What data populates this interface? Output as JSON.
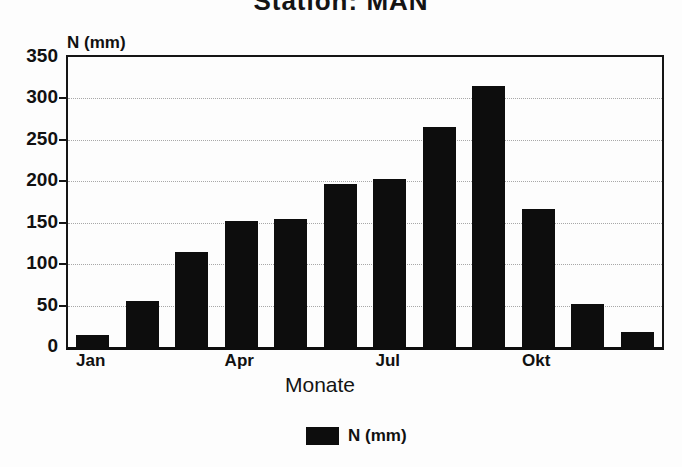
{
  "chart_data": {
    "type": "bar",
    "title": "Station: MAN",
    "ylabel": "N (mm)",
    "xlabel": "Monate",
    "n_bars": 12,
    "values": [
      15,
      55,
      115,
      152,
      154,
      197,
      203,
      265,
      315,
      166,
      52,
      18
    ],
    "x_tick_labels": [
      "Jan",
      "Apr",
      "Jul",
      "Okt"
    ],
    "x_tick_positions": [
      0,
      3,
      6,
      9
    ],
    "ylim": [
      0,
      350
    ],
    "yticks": [
      0,
      50,
      100,
      150,
      200,
      250,
      300,
      350
    ],
    "grid": "horizontal-dotted",
    "legend": {
      "label": "N (mm)",
      "position": "bottom"
    },
    "colors": {
      "bar": "#0d0d0d",
      "ink": "#111111",
      "grid": "#9a9a9a",
      "background": "#fdfdfd"
    }
  }
}
